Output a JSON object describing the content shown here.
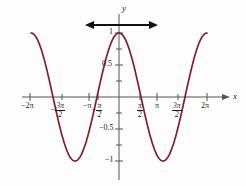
{
  "figure": {
    "title": "",
    "background_color": "#fdfdfd"
  },
  "chart_data": {
    "type": "line",
    "title": "",
    "xlabel": "x",
    "ylabel": "y",
    "function": "y = cos(x)",
    "xlim": [
      -6.2832,
      6.2832
    ],
    "ylim": [
      -1.15,
      1.15
    ],
    "grid": false,
    "legend": null,
    "curve_color": "#7e2233",
    "axis_color": "#555555",
    "annotation_color": "#111111",
    "xticks": [
      {
        "value": -6.2832,
        "label": "-2π",
        "pixel_x": 30
      },
      {
        "value": -4.7124,
        "label": "-3π/2",
        "pixel_x": 62
      },
      {
        "value": -3.1416,
        "label": "-π",
        "pixel_x": 89
      },
      {
        "value": -1.5708,
        "label": "-π/2",
        "pixel_x": 98
      },
      {
        "value": 1.5708,
        "label": "π/2",
        "pixel_x": 140
      },
      {
        "value": 3.1416,
        "label": "π",
        "pixel_x": 157
      },
      {
        "value": 4.7124,
        "label": "3π/2",
        "pixel_x": 178
      },
      {
        "value": 6.2832,
        "label": "2π",
        "pixel_x": 207
      }
    ],
    "yticks": [
      {
        "value": 1,
        "label": "1"
      },
      {
        "value": 0.5,
        "label": "0.5"
      },
      {
        "value": -0.5,
        "label": "-0.5"
      },
      {
        "value": -1,
        "label": "-1"
      }
    ],
    "x": [
      -6.2832,
      -5.8905,
      -5.4978,
      -5.1051,
      -4.7124,
      -4.3197,
      -3.927,
      -3.5343,
      -3.1416,
      -2.7489,
      -2.3562,
      -1.9635,
      -1.5708,
      -1.1781,
      -0.7854,
      -0.3927,
      0,
      0.3927,
      0.7854,
      1.1781,
      1.5708,
      1.9635,
      2.3562,
      2.7489,
      3.1416,
      3.5343,
      3.927,
      4.3197,
      4.7124,
      5.1051,
      5.4978,
      5.8905,
      6.2832
    ],
    "y": [
      0,
      -0.3827,
      -0.7071,
      -0.9239,
      -1,
      -0.9239,
      -0.7071,
      -0.3827,
      0,
      0.3827,
      0.7071,
      0.9239,
      1,
      0.9239,
      0.7071,
      0.3827,
      0,
      -0.3827,
      -0.7071,
      -0.9239,
      -1,
      -0.9239,
      -0.7071,
      -0.3827,
      0,
      0.3827,
      0.7071,
      0.9239,
      1,
      0.9239,
      0.7071,
      0.3827,
      0
    ]
  },
  "axes": {
    "x_axis_label": "x",
    "y_axis_label": "y"
  },
  "annotations": {
    "period_arrow": {
      "name": "double-headed-horizontal-arrow",
      "color": "#111111",
      "x_start_px": 86,
      "x_end_px": 157,
      "y_px": 25
    }
  },
  "tick_labels": {
    "neg_two_pi": "−2π",
    "neg_three_pi_over_two_num": "3π",
    "neg_three_pi_over_two_den": "2",
    "neg_pi": "−π",
    "neg_pi_over_two_num": "π",
    "neg_pi_over_two_den": "2",
    "pi_over_two_num": "π",
    "pi_over_two_den": "2",
    "pi": "π",
    "three_pi_over_two_num": "3π",
    "three_pi_over_two_den": "2",
    "two_pi": "2π",
    "minus_sign": "−",
    "y_one": "1",
    "y_half": "0.5",
    "y_neg_half": "−0.5",
    "y_neg_one": "−1"
  }
}
